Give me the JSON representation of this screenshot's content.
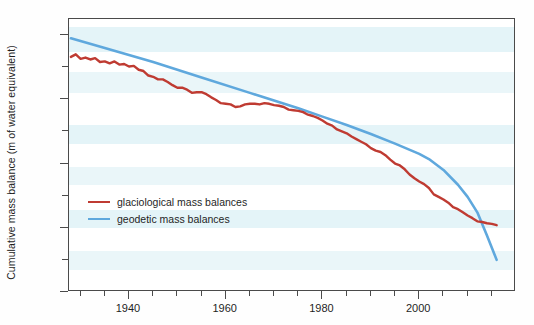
{
  "chart_data": {
    "type": "line",
    "title": "",
    "xlabel": "",
    "ylabel": "Cumulative mass balance (m of water equivalent)",
    "xlim": [
      1927.6,
      2020.0
    ],
    "ylim": [
      -30,
      12.5
    ],
    "xticks_major": [
      1940,
      1960,
      1980,
      2000
    ],
    "xticks_major_labels": [
      "1940",
      "1960",
      "1980",
      "2000"
    ],
    "xticks_minor": [
      1930,
      1935,
      1945,
      1950,
      1955,
      1965,
      1970,
      1975,
      1985,
      1990,
      1995,
      2005,
      2010,
      2015
    ],
    "yticks_major": [
      10,
      0,
      -10,
      -20,
      -30
    ],
    "yticks_major_labels": [
      "10",
      "0",
      "-10",
      "-20",
      "-30"
    ],
    "yticks_minor": [
      5,
      -5,
      -15,
      -25
    ],
    "grid": false,
    "background_bands": true,
    "legend_position": "inside-left-lower",
    "colors": {
      "glaciological": "#bf3b32",
      "geodetic": "#5fa8dd",
      "axis": "#4a4a4a",
      "band": "#ddf1f6",
      "plot_background": "#ffffff"
    },
    "series": [
      {
        "name": "glaciological mass balances",
        "color": "#bf3b32",
        "x": [
          1928,
          1929,
          1930,
          1931,
          1932,
          1933,
          1934,
          1935,
          1936,
          1937,
          1938,
          1939,
          1940,
          1941,
          1942,
          1943,
          1944,
          1945,
          1946,
          1947,
          1948,
          1949,
          1950,
          1951,
          1952,
          1953,
          1954,
          1955,
          1956,
          1957,
          1958,
          1959,
          1960,
          1961,
          1962,
          1963,
          1964,
          1965,
          1966,
          1967,
          1968,
          1969,
          1970,
          1971,
          1972,
          1973,
          1974,
          1975,
          1976,
          1977,
          1978,
          1979,
          1980,
          1981,
          1982,
          1983,
          1984,
          1985,
          1986,
          1987,
          1988,
          1989,
          1990,
          1991,
          1992,
          1993,
          1994,
          1995,
          1996,
          1997,
          1998,
          1999,
          2000,
          2001,
          2002,
          2003,
          2004,
          2005,
          2006,
          2007,
          2008,
          2009,
          2010,
          2011,
          2012,
          2013,
          2014,
          2015,
          2016
        ],
        "y": [
          6.6,
          7.0,
          6.3,
          6.5,
          6.2,
          6.4,
          5.8,
          5.9,
          5.6,
          5.9,
          5.4,
          5.5,
          5.1,
          5.2,
          4.6,
          4.4,
          3.7,
          3.5,
          3.1,
          3.1,
          2.7,
          2.2,
          1.8,
          1.8,
          1.5,
          1.0,
          1.1,
          1.1,
          0.8,
          0.3,
          -0.1,
          -0.6,
          -0.7,
          -0.8,
          -1.2,
          -1.1,
          -0.8,
          -0.7,
          -0.7,
          -0.8,
          -0.6,
          -0.7,
          -0.9,
          -1.0,
          -1.2,
          -1.6,
          -1.7,
          -1.8,
          -2.0,
          -2.4,
          -2.6,
          -2.9,
          -3.3,
          -3.8,
          -4.1,
          -4.7,
          -5.0,
          -5.3,
          -5.8,
          -6.2,
          -6.6,
          -7.0,
          -7.6,
          -8.0,
          -8.2,
          -8.7,
          -9.4,
          -10.0,
          -10.3,
          -10.9,
          -11.7,
          -12.3,
          -12.8,
          -13.2,
          -13.8,
          -14.8,
          -15.2,
          -15.6,
          -16.1,
          -16.8,
          -17.1,
          -17.6,
          -18.1,
          -18.5,
          -19.0,
          -19.1,
          -19.3,
          -19.4,
          -19.6
        ]
      },
      {
        "name": "geodetic mass balances",
        "color": "#5fa8dd",
        "x": [
          1928,
          1935,
          1945,
          1955,
          1965,
          1975,
          1980,
          1985,
          1990,
          1995,
          2000,
          2002,
          2005,
          2008,
          2010,
          2012,
          2014,
          2016
        ],
        "y": [
          9.5,
          8.0,
          5.8,
          3.4,
          1.0,
          -1.4,
          -2.7,
          -4.0,
          -5.4,
          -6.9,
          -8.5,
          -9.3,
          -11.0,
          -13.3,
          -15.2,
          -17.6,
          -21.2,
          -25.0
        ]
      }
    ]
  },
  "legend": {
    "items": [
      {
        "label": "glaciological mass balances",
        "color": "#bf3b32"
      },
      {
        "label": "geodetic mass balances",
        "color": "#5fa8dd"
      }
    ]
  },
  "axes": {
    "y_title": "Cumulative mass balance (m of water equivalent)",
    "y_labels": [
      "10",
      "0",
      "-10",
      "-20",
      "-30"
    ],
    "x_labels": [
      "1940",
      "1960",
      "1980",
      "2000"
    ]
  }
}
